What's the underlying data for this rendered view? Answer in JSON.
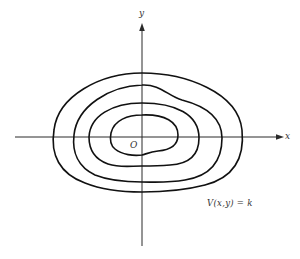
{
  "figure": {
    "axes": {
      "x_label": "x",
      "y_label": "y",
      "origin_label": "O"
    },
    "curve_label": "V(x,y) = k",
    "level_curve_count": 4,
    "colors": {
      "stroke": "#111111",
      "axis": "#2a2a2a",
      "background": "#ffffff"
    }
  }
}
